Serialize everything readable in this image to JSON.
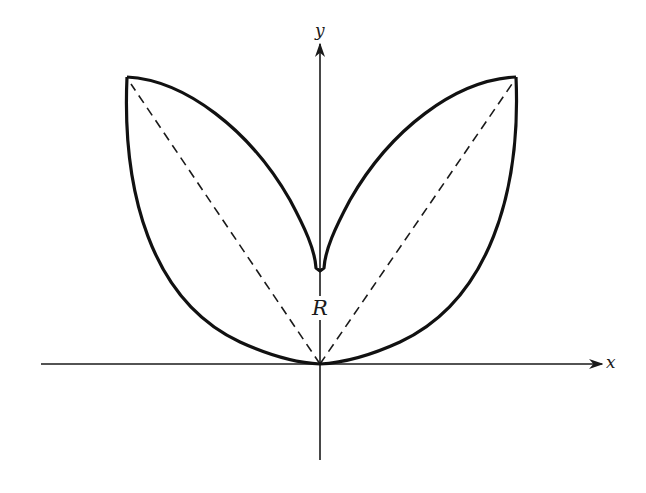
{
  "figure": {
    "type": "region diagram",
    "colors": {
      "curve": "#111111",
      "axis": "#1a1a1a",
      "dashed": "#1a1a1a",
      "background": "#ffffff"
    }
  },
  "axes": {
    "x_label": "x",
    "y_label": "y"
  },
  "region": {
    "label": "R"
  },
  "points": {
    "origin": [
      320,
      364
    ],
    "left_tip": [
      127,
      77
    ],
    "right_tip": [
      516,
      77
    ],
    "inner_cusp": [
      320,
      271
    ]
  }
}
